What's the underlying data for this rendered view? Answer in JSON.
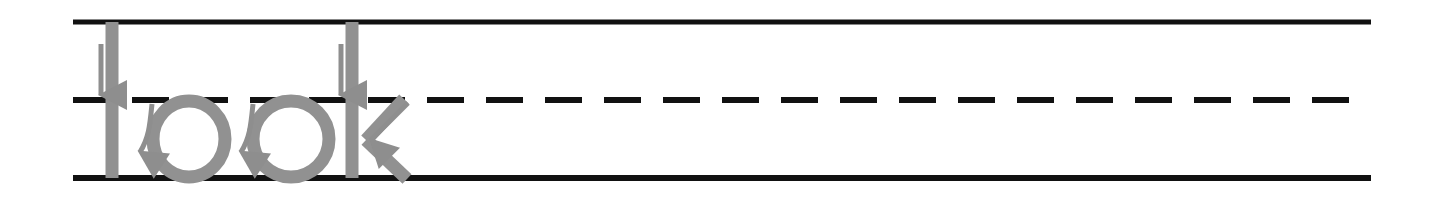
{
  "worksheet": {
    "type": "handwriting-tracing-worksheet",
    "word": "look",
    "letters": [
      "l",
      "o",
      "o",
      "k"
    ],
    "background_color": "#ffffff",
    "canvas": {
      "width": 1437,
      "height": 206
    }
  },
  "guide_lines": {
    "x_start": 73,
    "x_end": 1371,
    "color": "#111111",
    "top_line": {
      "label": "top-line",
      "y": 22,
      "style": "solid",
      "thickness": 5
    },
    "mid_line": {
      "label": "mid-line",
      "y": 100,
      "style": "dashed",
      "thickness": 6,
      "dash_length": 37,
      "dash_gap": 22
    },
    "base_line": {
      "label": "base-line",
      "y": 178,
      "style": "solid",
      "thickness": 6
    }
  },
  "tracing": {
    "stroke_color": "#919191",
    "stroke_width": 13,
    "letter_l": {
      "label": "l",
      "stem_x": 112,
      "top_y": 22,
      "bottom_y": 178
    },
    "letter_o_first": {
      "label": "o",
      "center_x": 189,
      "center_y": 139,
      "radius_x": 36,
      "radius_y": 38
    },
    "letter_o_second": {
      "label": "o",
      "center_x": 291,
      "center_y": 139,
      "radius_x": 38,
      "radius_y": 38
    },
    "letter_k": {
      "label": "k",
      "stem_x": 352,
      "top_y": 22,
      "bottom_y": 178,
      "vertex_x": 366,
      "vertex_y": 140,
      "arm_end_x": 404,
      "arm_end_y": 99,
      "leg_end_x": 407,
      "leg_end_y": 179
    }
  },
  "direction_arrows": {
    "arrow_color": "#8e8e8e",
    "items": [
      {
        "name": "arrow-down-letter-l",
        "shape": "straight-down",
        "start": {
          "x": 101,
          "y": 44
        },
        "end": {
          "x": 101,
          "y": 95
        }
      },
      {
        "name": "arrow-curve-letter-o-first",
        "shape": "curved-down-left",
        "start": {
          "x": 152,
          "y": 104
        },
        "end": {
          "x": 140,
          "y": 152
        }
      },
      {
        "name": "arrow-curve-letter-o-second",
        "shape": "curved-down-left",
        "start": {
          "x": 253,
          "y": 104
        },
        "end": {
          "x": 241,
          "y": 152
        }
      },
      {
        "name": "arrow-down-letter-k",
        "shape": "straight-down",
        "start": {
          "x": 341,
          "y": 44
        },
        "end": {
          "x": 341,
          "y": 95
        }
      },
      {
        "name": "arrow-diagonal-letter-k",
        "shape": "diagonal-down-left",
        "start": {
          "x": 408,
          "y": 103
        },
        "end": {
          "x": 371,
          "y": 140
        }
      }
    ]
  }
}
